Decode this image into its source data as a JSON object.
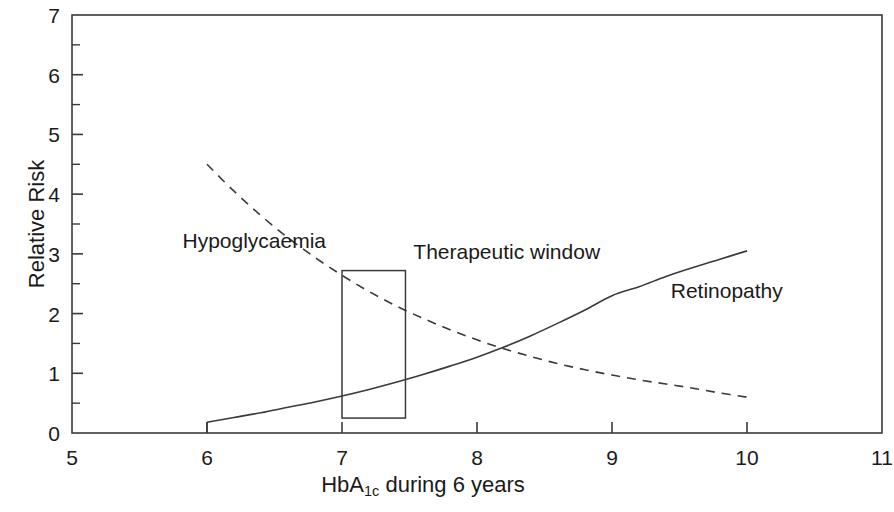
{
  "chart_data": {
    "type": "line",
    "title": "",
    "xlabel": "HbA1c during 6 years",
    "xlabel_base": "HbA",
    "xlabel_sub": "1c",
    "xlabel_tail": " during 6 years",
    "ylabel": "Relative Risk",
    "xlim": [
      5,
      11
    ],
    "ylim": [
      0,
      7
    ],
    "x_ticks": [
      "5",
      "6",
      "7",
      "8",
      "9",
      "10",
      "11"
    ],
    "x_tick_values": [
      5,
      6,
      7,
      8,
      9,
      10,
      11
    ],
    "y_ticks": [
      "0",
      "1",
      "2",
      "3",
      "4",
      "5",
      "6",
      "7"
    ],
    "y_tick_values": [
      0,
      1,
      2,
      3,
      4,
      5,
      6,
      7
    ],
    "x_minor_ticks": [],
    "y_minor_ticks": [
      0.5,
      1.5,
      2.5,
      3.5,
      4.5,
      5.5,
      6.5
    ],
    "grid": false,
    "legend": "inline-labels",
    "frame": "box",
    "line_color": "#3a3a3a",
    "series": [
      {
        "name": "Hypoglycaemia",
        "style": "dashed",
        "label_x": 6.35,
        "label_y": 3.23,
        "x": [
          6.0,
          6.2,
          6.4,
          6.6,
          6.8,
          7.0,
          7.2,
          7.4,
          7.6,
          7.8,
          8.0,
          8.2,
          8.4,
          8.6,
          8.8,
          9.0,
          9.2,
          9.4,
          9.6,
          9.8,
          10.0
        ],
        "values": [
          4.5,
          4.05,
          3.64,
          3.27,
          2.94,
          2.64,
          2.37,
          2.13,
          1.92,
          1.73,
          1.56,
          1.41,
          1.28,
          1.16,
          1.06,
          0.97,
          0.89,
          0.82,
          0.75,
          0.67,
          0.6
        ]
      },
      {
        "name": "Retinopathy",
        "style": "solid",
        "label_x": 9.85,
        "label_y": 2.4,
        "x": [
          6.0,
          6.2,
          6.4,
          6.6,
          6.8,
          7.0,
          7.2,
          7.4,
          7.6,
          7.8,
          8.0,
          8.2,
          8.4,
          8.6,
          8.8,
          9.0,
          9.2,
          9.4,
          9.6,
          9.8,
          10.0
        ],
        "values": [
          0.18,
          0.26,
          0.34,
          0.43,
          0.52,
          0.62,
          0.73,
          0.85,
          0.98,
          1.12,
          1.27,
          1.44,
          1.63,
          1.84,
          2.06,
          2.3,
          2.45,
          2.62,
          2.77,
          2.91,
          3.05
        ],
        "baseline_stub": {
          "x": 6.0,
          "y0": 0.0,
          "y1": 0.18
        }
      }
    ],
    "annotations": [
      {
        "name": "Therapeutic window",
        "type": "rect",
        "x0": 7.0,
        "x1": 7.47,
        "y0": 0.25,
        "y1": 2.72,
        "label": "Therapeutic window",
        "label_x": 8.22,
        "label_y": 3.05
      }
    ]
  }
}
